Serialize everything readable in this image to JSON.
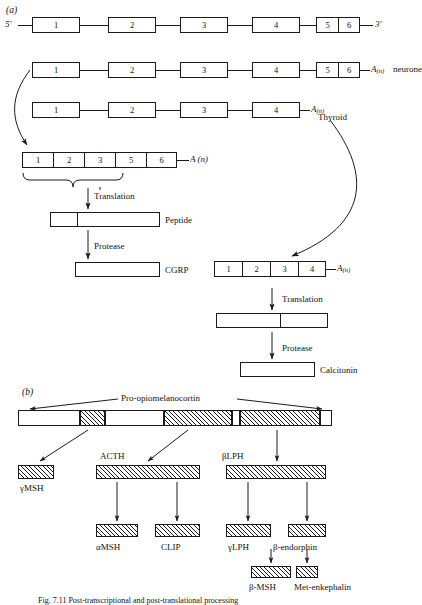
{
  "figure": {
    "caption": "Fig. 7.11  Post-transcriptional and post-translational processing",
    "panel_a_letter": "(a)",
    "panel_b_letter": "(b)"
  },
  "panel_a": {
    "primary_transcript": {
      "five_prime": "5'",
      "three_prime": "3'",
      "exons": [
        "1",
        "2",
        "3",
        "4",
        "5",
        "6"
      ]
    },
    "neurone_transcript": {
      "exons": [
        "1",
        "2",
        "3",
        "4",
        "5",
        "6"
      ],
      "tail_label": "A",
      "tail_sub": "(n)",
      "tissue": "neurone"
    },
    "thyroid_transcript": {
      "exons": [
        "1",
        "2",
        "3",
        "4"
      ],
      "tail_label": "A",
      "tail_sub": "(n)"
    },
    "thyroid_label": "Thyroid",
    "spliced_mrna": {
      "exons": [
        "1",
        "2",
        "3",
        "5",
        "6"
      ],
      "tail_label": "A",
      "tail_sub": "(n)"
    },
    "neurone_pathway": {
      "step1_label": "Translation",
      "product1_label": "Peptide",
      "step2_label": "Protease",
      "product2_label": "CGRP"
    },
    "thyroid_mrna": {
      "exons": [
        "1",
        "2",
        "3",
        "4"
      ],
      "tail_label": "A",
      "tail_sub": "(n)"
    },
    "thyroid_pathway": {
      "step1_label": "Translation",
      "step2_label": "Protease",
      "product2_label": "Calcitonin"
    }
  },
  "panel_b": {
    "precursor_label": "Pro-opiomelanocortin",
    "products_level1": [
      {
        "label": "γMSH"
      },
      {
        "label": "ACTH"
      },
      {
        "label": "βLPH"
      }
    ],
    "products_level2": [
      {
        "label": "αMSH"
      },
      {
        "label": "CLIP"
      },
      {
        "label": "γLPH"
      },
      {
        "label": "β-endorphin"
      }
    ],
    "products_level3": [
      {
        "label": "β-MSH"
      },
      {
        "label": "Met-enkephalin"
      }
    ]
  },
  "colors": {
    "ink": "#1a1a1a",
    "paper": "#ffffff"
  }
}
